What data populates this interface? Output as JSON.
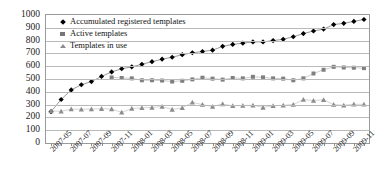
{
  "chart_data": {
    "type": "line",
    "title": "",
    "xlabel": "",
    "ylabel": "",
    "ylim": [
      0,
      1000
    ],
    "ytick_values": [
      0,
      100,
      200,
      300,
      400,
      500,
      600,
      700,
      800,
      900,
      1000
    ],
    "grid": true,
    "legend_position": "top-left",
    "x": [
      "2007-05",
      "2007-06",
      "2007-07",
      "2007-08",
      "2007-09",
      "2007-10",
      "2007-11",
      "2007-12",
      "2008-01",
      "2008-02",
      "2008-03",
      "2008-04",
      "2008-05",
      "2008-06",
      "2008-07",
      "2008-08",
      "2008-09",
      "2008-10",
      "2008-11",
      "2008-12",
      "2009-01",
      "2009-02",
      "2009-03",
      "2009-04",
      "2009-05",
      "2009-06",
      "2009-07",
      "2009-08",
      "2009-09",
      "2009-10",
      "2009-11",
      "2009-12"
    ],
    "xtick_labels": [
      "2007-05",
      "2007-07",
      "2007-09",
      "2007-11",
      "2008-01",
      "2008-03",
      "2008-05",
      "2008-07",
      "2008-09",
      "2008-11",
      "2009-01",
      "2009-03",
      "2009-05",
      "2009-07",
      "2009-09",
      "2009-11"
    ],
    "series": [
      {
        "name": "Accumulated registered templates",
        "marker": "diamond",
        "color": "#000000",
        "values": [
          245,
          340,
          415,
          455,
          480,
          520,
          555,
          580,
          595,
          615,
          635,
          655,
          670,
          690,
          705,
          715,
          725,
          755,
          770,
          780,
          790,
          790,
          800,
          810,
          830,
          855,
          875,
          890,
          925,
          935,
          950,
          965
        ]
      },
      {
        "name": "Active templates",
        "marker": "square",
        "color": "#808080",
        "values": [
          null,
          null,
          null,
          null,
          null,
          null,
          512,
          508,
          505,
          490,
          490,
          488,
          480,
          486,
          497,
          510,
          503,
          495,
          508,
          505,
          517,
          513,
          505,
          503,
          490,
          505,
          543,
          572,
          595,
          590,
          588,
          585
        ]
      },
      {
        "name": "Templates in use",
        "marker": "triangle",
        "color": "#8d8d8d",
        "values": [
          250,
          248,
          265,
          263,
          265,
          268,
          265,
          240,
          270,
          275,
          278,
          285,
          262,
          275,
          318,
          300,
          285,
          305,
          290,
          293,
          295,
          278,
          290,
          295,
          300,
          340,
          332,
          338,
          300,
          295,
          303,
          302
        ]
      }
    ]
  }
}
